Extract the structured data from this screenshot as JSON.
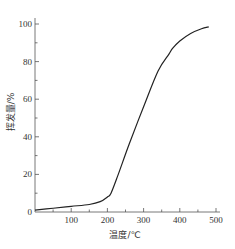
{
  "chart_data": {
    "type": "line",
    "title": "",
    "xlabel": "温度/℃",
    "ylabel": "挥发量/%",
    "xlim": [
      0,
      500
    ],
    "ylim": [
      0,
      100
    ],
    "x_ticks": [
      100,
      200,
      300,
      400,
      500
    ],
    "y_ticks": [
      0,
      20,
      40,
      60,
      80,
      100
    ],
    "grid": false,
    "legend": null,
    "series": [
      {
        "name": "挥发量",
        "x": [
          0,
          50,
          100,
          150,
          180,
          200,
          210,
          230,
          260,
          300,
          340,
          370,
          380,
          400,
          430,
          460,
          480
        ],
        "y": [
          1,
          2,
          3,
          4,
          5.5,
          8,
          10,
          20,
          36,
          56,
          75,
          84,
          87,
          91,
          95,
          97.5,
          98.5
        ]
      }
    ]
  },
  "axes": {
    "x_tick_labels": [
      "100",
      "200",
      "300",
      "400",
      "500"
    ],
    "y_tick_labels": [
      "0",
      "20",
      "40",
      "60",
      "80",
      "100"
    ],
    "x_title": "温度/℃",
    "y_title": "挥发量/%"
  }
}
